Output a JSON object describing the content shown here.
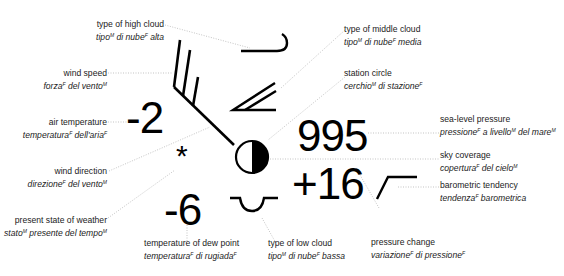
{
  "diagram": {
    "values": {
      "air_temperature": "-2",
      "dew_point": "-6",
      "pressure": "995",
      "pressure_change": "+16",
      "weather_symbol": "*"
    },
    "labels": [
      {
        "id": "high_cloud",
        "en": "type of high cloud",
        "it": "tipo",
        "it_sup": "M",
        "it_rest": " di nube",
        "it_sup2": "F",
        "it_end": " alta"
      },
      {
        "id": "wind_speed",
        "en": "wind speed",
        "it": "forza",
        "it_sup": "F",
        "it_rest": " del vento",
        "it_sup2": "M",
        "it_end": ""
      },
      {
        "id": "air_temp",
        "en": "air temperature",
        "it": "temperatura",
        "it_sup": "F",
        "it_rest": " dell'aria",
        "it_sup2": "F",
        "it_end": ""
      },
      {
        "id": "wind_dir",
        "en": "wind direction",
        "it": "direzione",
        "it_sup": "F",
        "it_rest": " del vento",
        "it_sup2": "M",
        "it_end": ""
      },
      {
        "id": "present_weather",
        "en": "present state of weather",
        "it": "stato",
        "it_sup": "M",
        "it_rest": " presente del tempo",
        "it_sup2": "M",
        "it_end": ""
      },
      {
        "id": "dew_point",
        "en": "temperature of dew point",
        "it": "temperatura",
        "it_sup": "F",
        "it_rest": " di rugiada",
        "it_sup2": "F",
        "it_end": ""
      },
      {
        "id": "low_cloud",
        "en": "type of low cloud",
        "it": "tipo",
        "it_sup": "M",
        "it_rest": " di nube",
        "it_sup2": "F",
        "it_end": " bassa"
      },
      {
        "id": "pressure_change",
        "en": "pressure change",
        "it": "variazione",
        "it_sup": "F",
        "it_rest": " di pressione",
        "it_sup2": "F",
        "it_end": ""
      },
      {
        "id": "middle_cloud",
        "en": "type of middle cloud",
        "it": "tipo",
        "it_sup": "M",
        "it_rest": " di nube",
        "it_sup2": "F",
        "it_end": " media"
      },
      {
        "id": "station_circle",
        "en": "station circle",
        "it": "cerchio",
        "it_sup": "M",
        "it_rest": " di stazione",
        "it_sup2": "F",
        "it_end": ""
      },
      {
        "id": "sea_pressure",
        "en": "sea-level pressure",
        "it": "pressione",
        "it_sup": "F",
        "it_rest": " a livello",
        "it_sup2": "M",
        "it_end": " del mare",
        "it_sup3": "M"
      },
      {
        "id": "sky_coverage",
        "en": "sky coverage",
        "it": "copertura",
        "it_sup": "F",
        "it_rest": " del cielo",
        "it_sup2": "M",
        "it_end": ""
      },
      {
        "id": "baro_tendency",
        "en": "barometric tendency",
        "it": "tendenza",
        "it_sup": "F",
        "it_rest": " barometrica",
        "it_sup2": "",
        "it_end": ""
      }
    ]
  }
}
